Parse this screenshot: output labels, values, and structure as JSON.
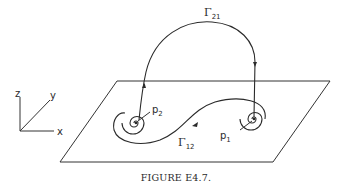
{
  "figure": {
    "caption": "FIGURE E4.7.",
    "axes": {
      "z_label": "z",
      "y_label": "y",
      "x_label": "x"
    },
    "points": {
      "p1": {
        "base": "p",
        "sub": "1"
      },
      "p2": {
        "base": "p",
        "sub": "2"
      }
    },
    "trajectories": {
      "gamma21": {
        "base": "Γ",
        "sub": "21"
      },
      "gamma12": {
        "base": "Γ",
        "sub": "12"
      }
    },
    "colors": {
      "ink": "#2a2a2a",
      "background": "#ffffff"
    }
  }
}
